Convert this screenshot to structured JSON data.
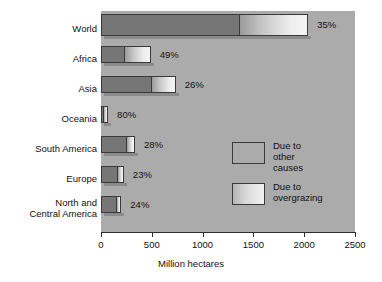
{
  "chart_data": {
    "type": "bar",
    "orientation": "horizontal",
    "stacked": true,
    "title": "",
    "xlabel": "Million hectares",
    "ylabel": "",
    "xlim": [
      0,
      2500
    ],
    "xticks": [
      "0",
      "500",
      "1000",
      "1500",
      "2000",
      "2500"
    ],
    "xtick_values": [
      0,
      500,
      1000,
      1500,
      2000,
      2500
    ],
    "grid": false,
    "legend_position": "middle-right",
    "categories": [
      "World",
      "Africa",
      "Asia",
      "Oceania",
      "South America",
      "Europe",
      "North and\nCentral America"
    ],
    "series": [
      {
        "name": "Due to other causes",
        "values": [
          1360,
          225,
          495,
          20,
          245,
          155,
          150
        ]
      },
      {
        "name": "Due to overgrazing",
        "values": [
          680,
          265,
          240,
          50,
          90,
          70,
          50
        ]
      }
    ],
    "point_labels": [
      "35%",
      "49%",
      "26%",
      "80%",
      "28%",
      "23%",
      "24%"
    ],
    "label_note": "percent of degradation due to overgrazing",
    "colors": {
      "plot_background": "#ababab",
      "page_background": "#ffffff",
      "other_causes": "#767676",
      "overgrazing": "#e6e6e6",
      "outline": "#3a3a3a",
      "text": "#111111"
    }
  },
  "legend": {
    "items": [
      {
        "label": "Due to\nother causes",
        "swatch": "other-causes"
      },
      {
        "label": "Due to\novergrazing",
        "swatch": "overgrazing"
      }
    ]
  },
  "axis": {
    "x_title": "Million hectares",
    "ticks": [
      "0",
      "500",
      "1000",
      "1500",
      "2000",
      "2500"
    ]
  },
  "rows": [
    {
      "category": "World",
      "pct": "35%"
    },
    {
      "category": "Africa",
      "pct": "49%"
    },
    {
      "category": "Asia",
      "pct": "26%"
    },
    {
      "category": "Oceania",
      "pct": "80%"
    },
    {
      "category": "South America",
      "pct": "28%"
    },
    {
      "category": "Europe",
      "pct": "23%"
    },
    {
      "category": "North and\nCentral America",
      "pct": "24%"
    }
  ]
}
